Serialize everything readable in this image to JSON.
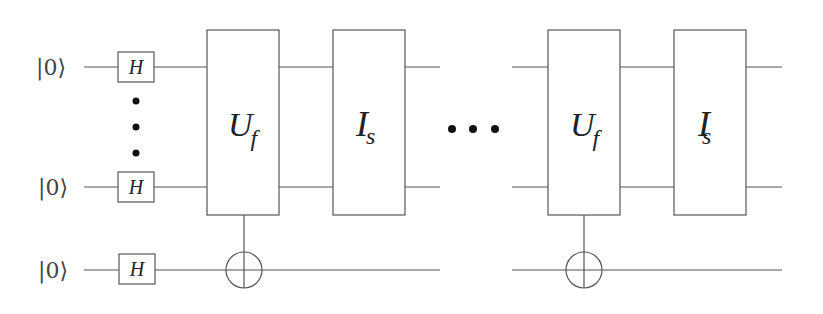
{
  "diagram": {
    "type": "quantum-circuit",
    "inputs": [
      {
        "label": "|0⟩",
        "gate": "H"
      },
      {
        "label": "|0⟩",
        "gate": "H"
      },
      {
        "label": "|0⟩",
        "gate": "H"
      }
    ],
    "vertical_ellipsis": "⋮",
    "blocks": [
      {
        "main": "U",
        "sub": "f"
      },
      {
        "main": "I",
        "sub": "s"
      },
      {
        "main": "U",
        "sub": "f"
      },
      {
        "main": "I",
        "sub": "s"
      }
    ],
    "horizontal_ellipsis": "•••"
  }
}
